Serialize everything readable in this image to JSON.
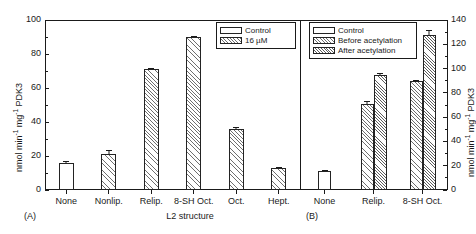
{
  "figure": {
    "panel_a_tag": "(A)",
    "panel_b_tag": "(B)",
    "x_axis_title": "L2 structure",
    "y_axis_title_left": "nmol min",
    "y_axis_title_left_sup1": "-1",
    "y_axis_title_left_mid": " mg",
    "y_axis_title_left_sup2": "-1",
    "y_axis_title_left_end": " PDK3",
    "y_axis_title_right": "nmol min",
    "y_axis_title_right_sup1": "-1",
    "y_axis_title_right_mid": " mg",
    "y_axis_title_right_sup2": "-1",
    "y_axis_title_right_end": " PDK3"
  },
  "legend_a": {
    "items": [
      {
        "label": "Control",
        "fill": "control"
      },
      {
        "label": "16 µM",
        "fill": "hatch"
      }
    ]
  },
  "legend_b": {
    "items": [
      {
        "label": "Control",
        "fill": "control"
      },
      {
        "label": "Before acetylation",
        "fill": "hatch"
      },
      {
        "label": "After acetylation",
        "fill": "hatch2"
      }
    ]
  },
  "axis_left": {
    "ticks": [
      "0",
      "20",
      "40",
      "60",
      "80",
      "100"
    ],
    "min": 0,
    "max": 100
  },
  "axis_right": {
    "ticks": [
      "0",
      "20",
      "40",
      "60",
      "80",
      "100",
      "120",
      "140"
    ],
    "min": 0,
    "max": 140
  },
  "chart_data": [
    {
      "type": "bar",
      "panel": "A",
      "title": "",
      "xlabel": "L2 structure",
      "ylabel": "nmol min-1 mg-1 PDK3",
      "ylim": [
        0,
        100
      ],
      "yticks": [
        0,
        20,
        40,
        60,
        80,
        100
      ],
      "grid": false,
      "legend_position": "top-right",
      "categories": [
        "None",
        "Nonlip.",
        "Relip.",
        "8-SH Oct.",
        "Oct.",
        "Hept."
      ],
      "series": [
        {
          "name": "Control",
          "fill": "control",
          "values": [
            16,
            null,
            null,
            null,
            null,
            null
          ],
          "errors": [
            0.8,
            null,
            null,
            null,
            null,
            null
          ]
        },
        {
          "name": "16 µM",
          "fill": "hatch",
          "values": [
            null,
            21,
            71,
            90,
            36,
            13
          ],
          "errors": [
            null,
            2.5,
            0.6,
            0.8,
            0.8,
            0.6
          ]
        }
      ]
    },
    {
      "type": "bar",
      "panel": "B",
      "title": "",
      "xlabel": "",
      "ylabel": "nmol min-1 mg-1 PDK3",
      "ylim": [
        0,
        140
      ],
      "yticks": [
        0,
        20,
        40,
        60,
        80,
        100,
        120,
        140
      ],
      "grid": false,
      "legend_position": "top-left",
      "categories": [
        "None",
        "Relip.",
        "8-SH Oct."
      ],
      "series": [
        {
          "name": "Control",
          "fill": "control",
          "values": [
            16,
            null,
            null
          ],
          "errors": [
            0.8,
            null,
            null
          ]
        },
        {
          "name": "Before acetylation",
          "fill": "hatch",
          "values": [
            null,
            71,
            90
          ],
          "errors": [
            null,
            2.0,
            1.0
          ]
        },
        {
          "name": "After acetylation",
          "fill": "hatch2",
          "values": [
            null,
            95,
            128
          ],
          "errors": [
            null,
            1.0,
            4.0
          ]
        }
      ]
    }
  ],
  "panel_a_xticklabels": [
    "None",
    "Nonlip.",
    "Relip.",
    "8-SH Oct.",
    "Oct.",
    "Hept."
  ],
  "panel_b_xticklabels": [
    "None",
    "Relip.",
    "8-SH Oct."
  ]
}
